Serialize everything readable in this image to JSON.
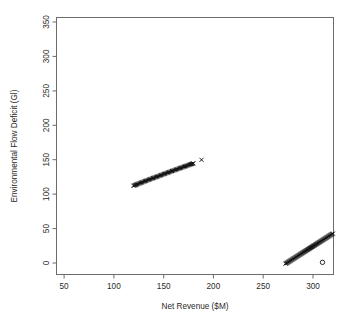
{
  "chart_data": {
    "type": "scatter",
    "title": "",
    "xlabel": "Net Revenue ($M)",
    "ylabel": "Environmental Flow Deficit (Gl)",
    "xlim": [
      35,
      312
    ],
    "ylim": [
      -13,
      368
    ],
    "xticks": [
      50,
      100,
      150,
      200,
      250,
      300
    ],
    "yticks": [
      0,
      50,
      100,
      150,
      200,
      250,
      300,
      350
    ],
    "xtick_labels": [
      "50",
      "100",
      "150",
      "200",
      "250",
      "300"
    ],
    "ytick_labels": [
      "0",
      "50",
      "100",
      "150",
      "200",
      "250",
      "300",
      "350"
    ],
    "grid": false,
    "legend": false,
    "frame": "box",
    "series": [
      {
        "name": "upper-front",
        "marker": "x",
        "color": "#121212",
        "points": [
          [
            112.0,
            118.5
          ],
          [
            112.8,
            119.0
          ],
          [
            113.5,
            119.4
          ],
          [
            114.3,
            119.9
          ],
          [
            115.1,
            120.4
          ],
          [
            115.9,
            120.9
          ],
          [
            116.7,
            121.4
          ],
          [
            117.5,
            121.9
          ],
          [
            118.4,
            122.4
          ],
          [
            119.2,
            122.9
          ],
          [
            120.1,
            123.4
          ],
          [
            120.9,
            123.9
          ],
          [
            121.8,
            124.4
          ],
          [
            122.7,
            124.9
          ],
          [
            123.5,
            125.4
          ],
          [
            124.4,
            125.9
          ],
          [
            125.3,
            126.4
          ],
          [
            126.2,
            126.9
          ],
          [
            127.1,
            127.4
          ],
          [
            128.0,
            127.9
          ],
          [
            128.9,
            128.4
          ],
          [
            129.8,
            128.9
          ],
          [
            130.7,
            129.4
          ],
          [
            131.6,
            129.9
          ],
          [
            132.5,
            130.4
          ],
          [
            133.4,
            130.9
          ],
          [
            134.3,
            131.4
          ],
          [
            135.2,
            131.9
          ],
          [
            136.1,
            132.4
          ],
          [
            137.0,
            132.9
          ],
          [
            137.9,
            133.4
          ],
          [
            138.8,
            133.9
          ],
          [
            139.7,
            134.4
          ],
          [
            140.6,
            134.9
          ],
          [
            141.5,
            135.4
          ],
          [
            142.4,
            135.9
          ],
          [
            143.3,
            136.4
          ],
          [
            144.2,
            136.9
          ],
          [
            145.1,
            137.4
          ],
          [
            146.0,
            137.9
          ],
          [
            146.9,
            138.4
          ],
          [
            147.8,
            138.9
          ],
          [
            148.7,
            139.4
          ],
          [
            149.6,
            139.9
          ],
          [
            150.5,
            140.4
          ],
          [
            151.4,
            140.9
          ],
          [
            152.3,
            141.3
          ],
          [
            153.2,
            141.8
          ],
          [
            154.1,
            142.3
          ],
          [
            155.0,
            142.8
          ],
          [
            155.9,
            143.3
          ],
          [
            156.8,
            143.8
          ],
          [
            157.7,
            144.2
          ],
          [
            158.6,
            144.7
          ],
          [
            159.5,
            145.2
          ],
          [
            160.3,
            145.7
          ],
          [
            161.2,
            146.1
          ],
          [
            162.1,
            146.6
          ],
          [
            163.0,
            147.1
          ],
          [
            163.8,
            147.5
          ],
          [
            164.7,
            148.0
          ],
          [
            165.5,
            148.4
          ],
          [
            166.4,
            148.9
          ],
          [
            167.2,
            149.3
          ],
          [
            168.0,
            149.8
          ],
          [
            168.8,
            150.2
          ],
          [
            169.6,
            150.6
          ],
          [
            170.4,
            151.0
          ],
          [
            171.2,
            151.4
          ],
          [
            171.9,
            151.8
          ]
        ]
      },
      {
        "name": "upper-outlier",
        "marker": "x",
        "color": "#121212",
        "points": [
          [
            180.0,
            157.0
          ]
        ]
      },
      {
        "name": "lower-front",
        "marker": "x",
        "color": "#121212",
        "points": [
          [
            264.0,
            3.0
          ],
          [
            264.6,
            3.5
          ],
          [
            265.2,
            4.1
          ],
          [
            265.8,
            4.6
          ],
          [
            266.4,
            5.2
          ],
          [
            267.0,
            5.8
          ],
          [
            267.6,
            6.3
          ],
          [
            268.2,
            6.9
          ],
          [
            268.8,
            7.5
          ],
          [
            269.4,
            8.0
          ],
          [
            270.0,
            8.6
          ],
          [
            270.6,
            9.2
          ],
          [
            271.2,
            9.7
          ],
          [
            271.8,
            10.3
          ],
          [
            272.4,
            10.9
          ],
          [
            273.0,
            11.4
          ],
          [
            273.6,
            12.0
          ],
          [
            274.2,
            12.6
          ],
          [
            274.8,
            13.1
          ],
          [
            275.4,
            13.7
          ],
          [
            276.0,
            14.3
          ],
          [
            276.6,
            14.8
          ],
          [
            277.2,
            15.4
          ],
          [
            277.8,
            16.0
          ],
          [
            278.4,
            16.5
          ],
          [
            279.0,
            17.1
          ],
          [
            279.6,
            17.7
          ],
          [
            280.2,
            18.2
          ],
          [
            280.8,
            18.8
          ],
          [
            281.4,
            19.4
          ],
          [
            282.0,
            19.9
          ],
          [
            282.6,
            20.5
          ],
          [
            283.2,
            21.1
          ],
          [
            283.8,
            21.6
          ],
          [
            284.4,
            22.2
          ],
          [
            285.0,
            22.8
          ],
          [
            285.6,
            23.3
          ],
          [
            286.2,
            23.9
          ],
          [
            286.8,
            24.5
          ],
          [
            287.4,
            25.0
          ],
          [
            288.0,
            25.6
          ],
          [
            288.6,
            26.2
          ],
          [
            289.2,
            26.7
          ],
          [
            289.8,
            27.3
          ],
          [
            290.4,
            27.9
          ],
          [
            291.0,
            28.4
          ],
          [
            291.6,
            29.0
          ],
          [
            292.2,
            29.6
          ],
          [
            292.8,
            30.1
          ],
          [
            293.4,
            30.7
          ],
          [
            294.0,
            31.3
          ],
          [
            294.6,
            31.8
          ],
          [
            295.2,
            32.4
          ],
          [
            295.8,
            33.0
          ],
          [
            296.4,
            33.5
          ],
          [
            297.0,
            34.1
          ],
          [
            297.6,
            34.7
          ],
          [
            298.2,
            35.2
          ],
          [
            298.8,
            35.8
          ],
          [
            299.4,
            36.4
          ],
          [
            300.0,
            36.9
          ],
          [
            300.6,
            37.5
          ],
          [
            301.2,
            38.1
          ],
          [
            301.8,
            38.6
          ],
          [
            302.4,
            39.2
          ],
          [
            303.0,
            39.8
          ],
          [
            303.6,
            40.3
          ],
          [
            304.2,
            40.9
          ],
          [
            304.8,
            41.5
          ],
          [
            305.4,
            42.0
          ],
          [
            306.0,
            42.6
          ],
          [
            306.6,
            43.2
          ],
          [
            307.2,
            43.7
          ],
          [
            307.8,
            44.3
          ],
          [
            308.4,
            44.9
          ],
          [
            309.0,
            45.4
          ],
          [
            309.6,
            46.0
          ],
          [
            310.2,
            46.6
          ],
          [
            310.8,
            47.1
          ],
          [
            311.4,
            47.7
          ]
        ]
      },
      {
        "name": "lower-outlier",
        "marker": "o",
        "color": "#121212",
        "points": [
          [
            301.0,
            5.0
          ]
        ]
      }
    ]
  }
}
